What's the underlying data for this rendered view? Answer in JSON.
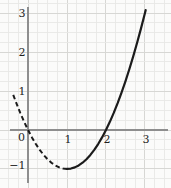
{
  "chart_data": {
    "type": "line",
    "title": "",
    "xlabel": "",
    "ylabel": "",
    "xlim": [
      -0.72,
      3.67
    ],
    "ylim": [
      -1.49,
      3.34
    ],
    "grid": {
      "visible": true,
      "minor_step": 0.25,
      "major_step": 1,
      "x_range": [
        -0.5,
        3.5
      ],
      "y_range": [
        -1.25,
        3.25
      ]
    },
    "x_ticks": [
      {
        "value": 1,
        "label": "1"
      },
      {
        "value": 2,
        "label": "2"
      },
      {
        "value": 3,
        "label": "3"
      }
    ],
    "y_ticks": [
      {
        "value": 3,
        "label": "3"
      },
      {
        "value": 2,
        "label": "2"
      },
      {
        "value": 1,
        "label": "1"
      },
      {
        "value": -1,
        "label": "−1"
      }
    ],
    "origin_label": "0",
    "series": [
      {
        "name": "parabola-dashed-branch",
        "style": "dashed",
        "points": [
          [
            -0.38,
            0.9
          ],
          [
            -0.3,
            0.69
          ],
          [
            -0.2,
            0.44
          ],
          [
            -0.1,
            0.21
          ],
          [
            0,
            0
          ],
          [
            0.1,
            -0.19
          ],
          [
            0.2,
            -0.36
          ],
          [
            0.3,
            -0.51
          ],
          [
            0.4,
            -0.64
          ],
          [
            0.5,
            -0.75
          ],
          [
            0.6,
            -0.84
          ],
          [
            0.7,
            -0.91
          ],
          [
            0.8,
            -0.96
          ],
          [
            0.9,
            -0.99
          ],
          [
            1,
            -1
          ]
        ]
      },
      {
        "name": "parabola-solid-branch",
        "style": "solid",
        "points": [
          [
            1,
            -1
          ],
          [
            1.1,
            -0.99
          ],
          [
            1.2,
            -0.96
          ],
          [
            1.3,
            -0.91
          ],
          [
            1.4,
            -0.84
          ],
          [
            1.5,
            -0.75
          ],
          [
            1.6,
            -0.64
          ],
          [
            1.7,
            -0.51
          ],
          [
            1.8,
            -0.36
          ],
          [
            1.9,
            -0.19
          ],
          [
            2,
            0
          ],
          [
            2.1,
            0.21
          ],
          [
            2.2,
            0.44
          ],
          [
            2.3,
            0.69
          ],
          [
            2.4,
            0.96
          ],
          [
            2.5,
            1.25
          ],
          [
            2.6,
            1.56
          ],
          [
            2.7,
            1.89
          ],
          [
            2.8,
            2.24
          ],
          [
            2.9,
            2.61
          ],
          [
            3,
            3
          ],
          [
            3.02,
            3.08
          ]
        ]
      }
    ],
    "colors": {
      "curve": "#1b1b1b",
      "axis": "#8e8e8e",
      "grid_minor": "#e8e8e6",
      "grid_major": "#d7d7d4",
      "label": "#1f1f1f",
      "background": "#fbfbfa"
    }
  }
}
